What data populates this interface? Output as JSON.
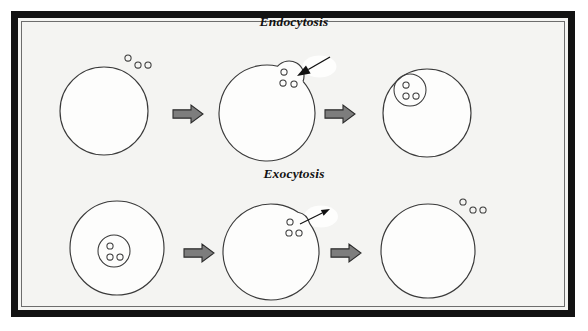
{
  "figure": {
    "title_top": "Endocytosis",
    "title_bottom": "Exocytosis",
    "background_color": "#f4f4f2",
    "frame_color": "#121212",
    "stroke_color": "#3a3a3a",
    "block_arrow_fill": "#7d7d7d",
    "block_arrow_stroke": "#2b2b2b"
  },
  "rows": [
    {
      "name": "endocytosis",
      "label": "Endocytosis",
      "label_x": 294,
      "label_y": 26,
      "direction": "inward",
      "stages": [
        {
          "name": "stage-1-particles-outside",
          "cell": {
            "cx": 104,
            "cy": 111,
            "r": 44
          },
          "vesicle": null,
          "pocket": null,
          "external_particles": [
            {
              "cx": 128,
              "cy": 58,
              "r": 3.1
            },
            {
              "cx": 138,
              "cy": 65,
              "r": 3.1
            },
            {
              "cx": 148,
              "cy": 65,
              "r": 3.1
            }
          ],
          "internal_particles": []
        },
        {
          "name": "stage-2-invagination",
          "cell": {
            "cx": 267,
            "cy": 113,
            "r": 48
          },
          "vesicle": null,
          "pocket": {
            "cx": 289,
            "cy": 76,
            "r": 15
          },
          "external_particles": [],
          "internal_particles": [
            {
              "cx": 284,
              "cy": 72,
              "r": 3.1
            },
            {
              "cx": 283,
              "cy": 83,
              "r": 3.1
            },
            {
              "cx": 294,
              "cy": 84,
              "r": 3.1
            }
          ],
          "arrow": {
            "name": "uptake-arrow",
            "x1": 330,
            "y1": 57,
            "x2": 297,
            "y2": 76,
            "head_size": 9,
            "line_width": 1.4,
            "style": "solid-head"
          }
        },
        {
          "name": "stage-3-vesicle-inside",
          "cell": {
            "cx": 427,
            "cy": 113,
            "r": 44
          },
          "vesicle": {
            "cx": 410,
            "cy": 90,
            "r": 16
          },
          "pocket": null,
          "external_particles": [],
          "internal_particles": [
            {
              "cx": 406,
              "cy": 85,
              "r": 3.1
            },
            {
              "cx": 406,
              "cy": 96,
              "r": 3.1
            },
            {
              "cx": 416,
              "cy": 96,
              "r": 3.1
            }
          ]
        }
      ],
      "block_arrows": [
        {
          "name": "step-arrow-1",
          "x": 173,
          "y": 114,
          "w": 30,
          "h": 18
        },
        {
          "name": "step-arrow-2",
          "x": 325,
          "y": 114,
          "w": 30,
          "h": 18
        }
      ]
    },
    {
      "name": "exocytosis",
      "label": "Exocytosis",
      "label_x": 294,
      "label_y": 178,
      "direction": "outward",
      "stages": [
        {
          "name": "stage-1-vesicle-inside",
          "cell": {
            "cx": 117,
            "cy": 248,
            "r": 47
          },
          "vesicle": {
            "cx": 114,
            "cy": 251,
            "r": 16
          },
          "pocket": null,
          "external_particles": [],
          "internal_particles": [
            {
              "cx": 110,
              "cy": 246,
              "r": 3.1
            },
            {
              "cx": 110,
              "cy": 257,
              "r": 3.1
            },
            {
              "cx": 120,
              "cy": 257,
              "r": 3.1
            }
          ]
        },
        {
          "name": "stage-2-fusion-pore",
          "cell": {
            "cx": 271,
            "cy": 252,
            "r": 48
          },
          "vesicle": null,
          "pocket": {
            "cx": 295,
            "cy": 227,
            "r": 15
          },
          "external_particles": [],
          "internal_particles": [
            {
              "cx": 290,
              "cy": 222,
              "r": 3.1
            },
            {
              "cx": 289,
              "cy": 233,
              "r": 3.1
            },
            {
              "cx": 299,
              "cy": 233,
              "r": 3.1
            }
          ],
          "arrow": {
            "name": "release-arrow",
            "x1": 300,
            "y1": 224,
            "x2": 330,
            "y2": 209,
            "head_size": 6,
            "line_width": 1.1,
            "style": "solid-head"
          }
        },
        {
          "name": "stage-3-particles-outside",
          "cell": {
            "cx": 428,
            "cy": 251,
            "r": 47
          },
          "vesicle": null,
          "pocket": null,
          "external_particles": [
            {
              "cx": 463,
              "cy": 202,
              "r": 3.1
            },
            {
              "cx": 473,
              "cy": 210,
              "r": 3.1
            },
            {
              "cx": 483,
              "cy": 210,
              "r": 3.1
            }
          ],
          "internal_particles": []
        }
      ],
      "block_arrows": [
        {
          "name": "step-arrow-3",
          "x": 184,
          "y": 253,
          "w": 30,
          "h": 18
        },
        {
          "name": "step-arrow-4",
          "x": 331,
          "y": 253,
          "w": 30,
          "h": 18
        }
      ]
    }
  ]
}
